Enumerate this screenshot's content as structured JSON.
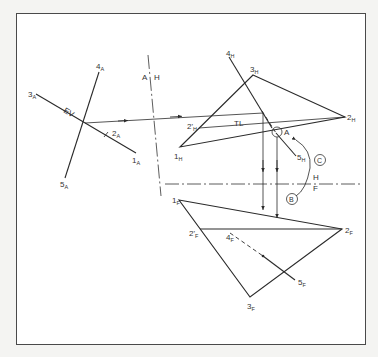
{
  "figure": {
    "title": "",
    "views": {
      "auxiliary": {
        "labels": {
          "p1": "1",
          "p1_sub": "A",
          "p2": "2",
          "p2_sub": "A",
          "p3": "3",
          "p3_sub": "A",
          "p4": "4",
          "p4_sub": "A",
          "p5": "5",
          "p5_sub": "A",
          "ev": "EV"
        }
      },
      "horizontal": {
        "labels": {
          "p1": "1",
          "p1_sub": "H",
          "p2": "2",
          "p2_sub": "H",
          "p2p": "2'",
          "p2p_sub": "H",
          "p3": "3",
          "p3_sub": "H",
          "p4": "4",
          "p4_sub": "H",
          "p5": "5",
          "p5_sub": "H",
          "tl": "TL",
          "pierce": "A"
        }
      },
      "frontal": {
        "labels": {
          "p1": "1",
          "p1_sub": "F",
          "p2": "2",
          "p2_sub": "F",
          "p2p": "2'",
          "p2p_sub": "F",
          "p3": "3",
          "p3_sub": "F",
          "p4": "4",
          "p4_sub": "F",
          "p5": "5",
          "p5_sub": "F"
        }
      }
    },
    "fold_lines": {
      "ah": {
        "left": "A",
        "right": "H"
      },
      "hf": {
        "top": "H",
        "bottom": "F"
      }
    },
    "callouts": {
      "b": "B",
      "c": "C"
    },
    "colors": {
      "line": "#2a2a2a",
      "frame": "#4a4a4a",
      "background": "#ffffff",
      "page": "#f4f4f2"
    }
  }
}
